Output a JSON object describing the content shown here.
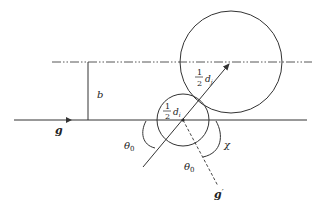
{
  "diagram": {
    "type": "collision-geometry",
    "colors": {
      "stroke": "#333333",
      "text": "#222222",
      "background": "#ffffff"
    },
    "labels": {
      "g": "g",
      "g_prime": "g",
      "g_prime_mark": "′",
      "b": "b",
      "theta0_left": "θ",
      "theta0_left_sub": "0",
      "theta0_right": "θ",
      "theta0_right_sub": "0",
      "chi": "χ",
      "half_num_small": "1",
      "half_den_small": "2",
      "d_small": "d",
      "d_small_sub": "i",
      "half_num_large": "1",
      "half_den_large": "2",
      "d_large": "d",
      "d_large_sub": "j"
    },
    "elements": [
      {
        "id": "incoming-line",
        "kind": "solid line with arrow",
        "label": "g"
      },
      {
        "id": "offset-line",
        "kind": "dash-dot line"
      },
      {
        "id": "impact-parameter",
        "kind": "vertical segment",
        "label": "b"
      },
      {
        "id": "small-circle",
        "kind": "circle",
        "label": "½ d_i"
      },
      {
        "id": "large-circle",
        "kind": "circle",
        "label": "½ d_j"
      },
      {
        "id": "center-line",
        "kind": "arrow"
      },
      {
        "id": "outgoing-line",
        "kind": "dashed line",
        "label": "g′"
      },
      {
        "id": "angle-theta0-left",
        "kind": "arc",
        "label": "θ0"
      },
      {
        "id": "angle-theta0-right",
        "kind": "arc",
        "label": "θ0"
      },
      {
        "id": "angle-chi",
        "kind": "arc",
        "label": "χ"
      }
    ]
  }
}
